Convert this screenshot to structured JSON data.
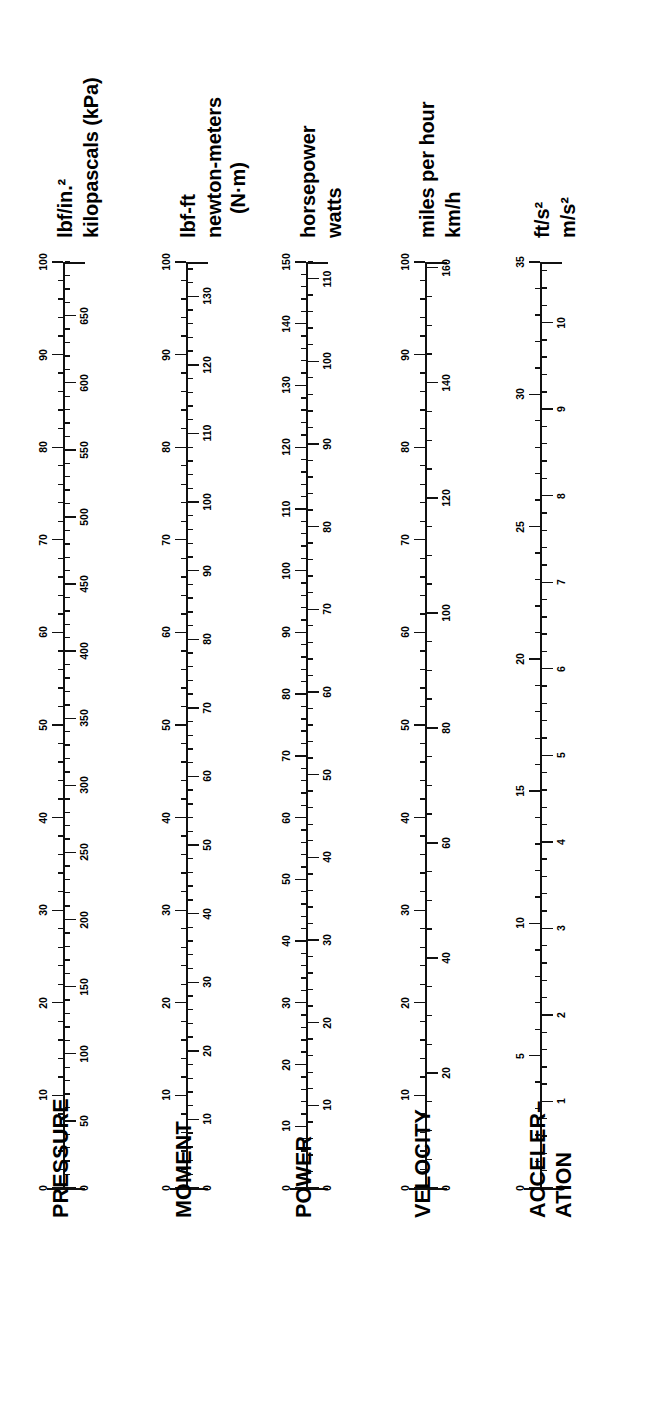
{
  "page": {
    "orientation": "rotated-90-ccw",
    "ink_color": "#111111",
    "background_color": "#ffffff"
  },
  "chart_data": {
    "type": "table",
    "grid": false,
    "legend": "none",
    "scales": [
      {
        "category": "PRESSURE",
        "left": {
          "unit": "lbf/in.²",
          "min": 0,
          "max": 100,
          "major_step": 10,
          "minor_step": 2,
          "labels": [
            "0",
            "10",
            "20",
            "30",
            "40",
            "50",
            "60",
            "70",
            "80",
            "90",
            "100"
          ]
        },
        "right": {
          "unit": "kilopascals (kPa)",
          "min": 0,
          "max": 690,
          "major_step": 50,
          "minor_step": 10,
          "labels": [
            "0",
            "50",
            "100",
            "150",
            "200",
            "250",
            "300",
            "350",
            "400",
            "450",
            "500",
            "550",
            "600",
            "650"
          ]
        }
      },
      {
        "category": "MOMENT",
        "left": {
          "unit": "lbf-ft",
          "min": 0,
          "max": 100,
          "major_step": 10,
          "minor_step": 2,
          "labels": [
            "0",
            "10",
            "20",
            "30",
            "40",
            "50",
            "60",
            "70",
            "80",
            "90",
            "100"
          ]
        },
        "right": {
          "unit": "newton-meters (N·m)",
          "unit_line1": "newton-meters",
          "unit_line2": "(N·m)",
          "min": 0,
          "max": 135,
          "major_step": 10,
          "minor_step": 2,
          "labels": [
            "0",
            "10",
            "20",
            "30",
            "40",
            "50",
            "60",
            "70",
            "80",
            "90",
            "100",
            "110",
            "120",
            "130"
          ]
        }
      },
      {
        "category": "POWER",
        "left": {
          "unit": "horsepower",
          "min": 0,
          "max": 150,
          "major_step": 10,
          "minor_step": 2,
          "labels": [
            "0",
            "10",
            "20",
            "30",
            "40",
            "50",
            "60",
            "70",
            "80",
            "90",
            "100",
            "110",
            "120",
            "130",
            "140",
            "150"
          ]
        },
        "right": {
          "unit": "watts",
          "min": 0,
          "max": 112,
          "major_step": 10,
          "minor_step": 2,
          "labels": [
            "0",
            "10",
            "20",
            "30",
            "40",
            "50",
            "60",
            "70",
            "80",
            "90",
            "100",
            "110"
          ]
        }
      },
      {
        "category": "VELOCITY",
        "left": {
          "unit": "miles per hour",
          "min": 0,
          "max": 100,
          "major_step": 10,
          "minor_step": 2,
          "labels": [
            "0",
            "10",
            "20",
            "30",
            "40",
            "50",
            "60",
            "70",
            "80",
            "90",
            "100"
          ]
        },
        "right": {
          "unit": "km/h",
          "min": 0,
          "max": 161,
          "major_step": 20,
          "minor_step": 5,
          "labels": [
            "0",
            "20",
            "40",
            "60",
            "80",
            "100",
            "120",
            "140",
            "160"
          ]
        }
      },
      {
        "category": "ACCELERATION",
        "category_line1": "ACCELER–",
        "category_line2": "ATION",
        "left": {
          "unit": "ft/s²",
          "min": 0,
          "max": 35,
          "major_step": 5,
          "minor_step": 1,
          "labels": [
            "0",
            "5",
            "10",
            "15",
            "20",
            "25",
            "30",
            "35"
          ]
        },
        "right": {
          "unit": "m/s²",
          "min": 0,
          "max": 10.7,
          "major_step": 1,
          "minor_step": 0.2,
          "labels": [
            "0",
            "1",
            "2",
            "3",
            "4",
            "5",
            "6",
            "7",
            "8",
            "9",
            "10"
          ]
        }
      }
    ]
  }
}
